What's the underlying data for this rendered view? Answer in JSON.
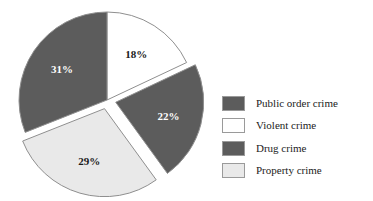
{
  "chart_data": {
    "type": "pie",
    "title": "",
    "subtitle": "",
    "xlabel": "",
    "ylabel": "",
    "legend_position": "right",
    "grid": false,
    "categories": [
      "Public order crime",
      "Violent crime",
      "Drug crime",
      "Property crime"
    ],
    "values": [
      31,
      22,
      18,
      29
    ],
    "slices": [
      {
        "label": "Violent crime",
        "value": 18,
        "value_label": "18%",
        "color": "#ffffff",
        "label_color": "#1a1a1a",
        "exploded": false,
        "start_angle": 0,
        "end_angle": 64.8
      },
      {
        "label": "Drug crime",
        "value": 22,
        "value_label": "22%",
        "color": "#5c5c5c",
        "label_color": "#ffffff",
        "exploded": true,
        "start_angle": 64.8,
        "end_angle": 144.0
      },
      {
        "label": "Property crime",
        "value": 29,
        "value_label": "29%",
        "color": "#e9e9e9",
        "label_color": "#1a1a1a",
        "exploded": true,
        "start_angle": 144.0,
        "end_angle": 248.4
      },
      {
        "label": "Public order crime",
        "value": 31,
        "value_label": "31%",
        "color": "#5c5c5c",
        "label_color": "#ffffff",
        "exploded": false,
        "start_angle": 248.4,
        "end_angle": 360
      }
    ],
    "annotations": [
      "18%",
      "22%",
      "29%",
      "31%"
    ]
  },
  "legend": {
    "items": [
      {
        "label": "Public order crime",
        "color": "#5c5c5c",
        "border": "#9a9a9a"
      },
      {
        "label": "Violent crime",
        "color": "#ffffff",
        "border": "#9a9a9a"
      },
      {
        "label": "Drug crime",
        "color": "#5c5c5c",
        "border": "#9a9a9a"
      },
      {
        "label": "Property crime",
        "color": "#e9e9e9",
        "border": "#9a9a9a"
      }
    ]
  }
}
